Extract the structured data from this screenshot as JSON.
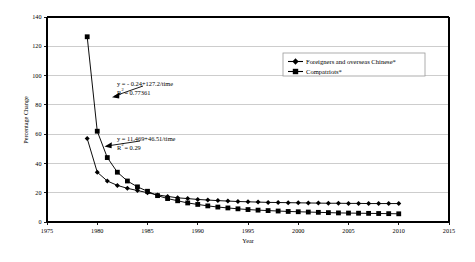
{
  "chart_data": {
    "type": "line",
    "title": "",
    "xlabel": "Year",
    "ylabel": "Percentage Change",
    "xlim": [
      1975,
      2015
    ],
    "ylim": [
      0,
      140
    ],
    "xticks": [
      1975,
      1980,
      1985,
      1990,
      1995,
      2000,
      2005,
      2010,
      2015
    ],
    "yticks": [
      0,
      20,
      40,
      60,
      80,
      100,
      120,
      140
    ],
    "grid": "horizontal",
    "legend_position": "top-right",
    "series": [
      {
        "name": "Foreigners and overseas Chinese*",
        "marker": "diamond",
        "x": [
          1979,
          1980,
          1981,
          1982,
          1983,
          1984,
          1985,
          1986,
          1987,
          1988,
          1989,
          1990,
          1991,
          1992,
          1993,
          1994,
          1995,
          1996,
          1997,
          1998,
          1999,
          2000,
          2001,
          2002,
          2003,
          2004,
          2005,
          2006,
          2007,
          2008,
          2009,
          2010
        ],
        "values": [
          57.0,
          34.0,
          28.0,
          25.0,
          23.0,
          21.5,
          20.0,
          18.5,
          17.5,
          16.5,
          16.0,
          15.4,
          15.0,
          14.6,
          14.3,
          14.0,
          13.8,
          13.6,
          13.4,
          13.3,
          13.2,
          13.1,
          13.0,
          12.9,
          12.8,
          12.8,
          12.7,
          12.7,
          12.6,
          12.6,
          12.6,
          12.6
        ]
      },
      {
        "name": "Compatriots*",
        "marker": "square",
        "x": [
          1979,
          1980,
          1981,
          1982,
          1983,
          1984,
          1985,
          1986,
          1987,
          1988,
          1989,
          1990,
          1991,
          1992,
          1993,
          1994,
          1995,
          1996,
          1997,
          1998,
          1999,
          2000,
          2001,
          2002,
          2003,
          2004,
          2005,
          2006,
          2007,
          2008,
          2009,
          2010
        ],
        "values": [
          126.5,
          62.0,
          44.0,
          34.0,
          28.0,
          24.0,
          21.0,
          18.0,
          16.0,
          14.5,
          13.0,
          12.0,
          11.0,
          10.2,
          9.6,
          9.0,
          8.5,
          8.1,
          7.8,
          7.5,
          7.2,
          7.0,
          6.8,
          6.6,
          6.4,
          6.2,
          6.1,
          6.0,
          5.9,
          5.8,
          5.7,
          5.6
        ]
      }
    ],
    "annotations": [
      {
        "id": "compatriots-fit",
        "equation": "y = - 0.24+127.2/time",
        "r_squared_label": "R",
        "r_squared_sup": "2",
        "r_squared_value": "= 0.77361",
        "target_x": 1981.2,
        "target_y": 80.0
      },
      {
        "id": "foreigners-fit",
        "equation": "y = 11.469+46.51/time",
        "r_squared_label": "R",
        "r_squared_sup": "2",
        "r_squared_value": "= 0.29",
        "target_x": 1981.0,
        "target_y": 46.0
      }
    ]
  },
  "axes": {
    "y_title": "Percentage Change",
    "x_title": "Year",
    "y_tick_labels": [
      "0",
      "20",
      "40",
      "60",
      "80",
      "100",
      "120",
      "140"
    ],
    "x_tick_labels": [
      "1975",
      "1980",
      "1985",
      "1990",
      "1995",
      "2000",
      "2005",
      "2010",
      "2015"
    ]
  },
  "legend": {
    "items": [
      {
        "label": "Foreigners and overseas Chinese*",
        "marker": "diamond"
      },
      {
        "label": "Compatriots*",
        "marker": "square"
      }
    ]
  },
  "annotations_text": {
    "eq1_line1": "y = - 0.24+127.2/time",
    "eq1_r": "R",
    "eq1_sup": "2",
    "eq1_val": "= 0.77361",
    "eq2_line1": "y = 11.469+46.51/time",
    "eq2_r": "R",
    "eq2_sup": "2",
    "eq2_val": "= 0.29"
  },
  "colors": {
    "series": "#000000",
    "grid": "#b8b8b8",
    "axis": "#000000",
    "background": "#ffffff"
  }
}
